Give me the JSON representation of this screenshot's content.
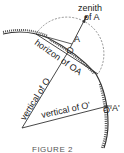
{
  "diagram": {
    "type": "geometry",
    "caption": "FIGURE 2",
    "labels": {
      "zenith_line1": "zenith",
      "zenith_line2": "of A",
      "point_A": "A",
      "point_O": "O",
      "horizon": "horizon of OA",
      "vertical_O": "vertical of O",
      "vertical_O_prime": "vertical of O'",
      "point_O_prime": "O'",
      "point_A_prime": "A'"
    },
    "colors": {
      "line": "#333333",
      "dashed_circle": "#666666",
      "earth_hatch": "#444444"
    }
  }
}
